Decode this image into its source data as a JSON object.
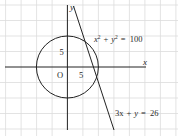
{
  "figure": {
    "axes": {
      "x_label": "x",
      "y_label": "y",
      "origin_label": "O",
      "x_tick_label": "5",
      "y_tick_label": "5",
      "grid_step_units": 5
    },
    "circle": {
      "equation_lhs_x": "x",
      "equation_lhs_y": "y",
      "sup": "2",
      "equation_rhs": "100",
      "equation_text": "x² + y² = 100",
      "center": [
        0,
        0
      ],
      "radius": 10
    },
    "line": {
      "equation_text": "3x + y = 26",
      "coef_x": "3x",
      "y": "y",
      "rhs": "26"
    },
    "colors": {
      "grid": "#d9d9d9",
      "axes": "#222222",
      "curve": "#222222",
      "text": "#2a2a2a",
      "background": "#ffffff"
    }
  }
}
